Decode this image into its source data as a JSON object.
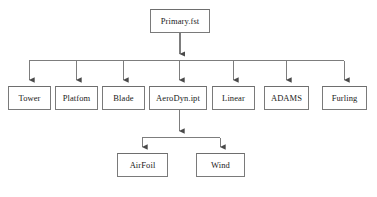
{
  "diagram": {
    "title_text": "",
    "type": "hierarchical-tree-flowchart",
    "colors": {
      "background": "#ffffff",
      "box_border": "#7a7a7a",
      "box_fill": "#ffffff",
      "connector": "#6e6e6e",
      "text": "#1a1a1a"
    },
    "levels": [
      {
        "level": 1,
        "nodes": [
          {
            "id": "primary",
            "label": "Primary.fst",
            "x": 150,
            "y": 9,
            "w": 60,
            "h": 24
          }
        ]
      },
      {
        "level": 2,
        "nodes": [
          {
            "id": "tower",
            "label": "Tower",
            "x": 8,
            "y": 86,
            "w": 43,
            "h": 24
          },
          {
            "id": "platfom",
            "label": "Platfom",
            "x": 55,
            "y": 86,
            "w": 43,
            "h": 24
          },
          {
            "id": "blade",
            "label": "Blade",
            "x": 102,
            "y": 86,
            "w": 43,
            "h": 24
          },
          {
            "id": "aerodyn",
            "label": "AeroDyn.ipt",
            "x": 149,
            "y": 86,
            "w": 58,
            "h": 24
          },
          {
            "id": "linear",
            "label": "Linear",
            "x": 212,
            "y": 86,
            "w": 43,
            "h": 24
          },
          {
            "id": "adams",
            "label": "ADAMS",
            "x": 264,
            "y": 86,
            "w": 45,
            "h": 24
          },
          {
            "id": "furling",
            "label": "Furling",
            "x": 322,
            "y": 86,
            "w": 45,
            "h": 24
          }
        ]
      },
      {
        "level": 3,
        "nodes": [
          {
            "id": "airfoil",
            "label": "AirFoil",
            "x": 117,
            "y": 153,
            "w": 51,
            "h": 24
          },
          {
            "id": "wind",
            "label": "Wind",
            "x": 196,
            "y": 153,
            "w": 49,
            "h": 24
          }
        ]
      }
    ],
    "edges": [
      {
        "from": "primary",
        "to": "bus-level-2",
        "style": "arrow-down"
      },
      {
        "from": "bus-level-2",
        "to": "tower",
        "style": "arrow-down"
      },
      {
        "from": "bus-level-2",
        "to": "platfom",
        "style": "arrow-down"
      },
      {
        "from": "bus-level-2",
        "to": "blade",
        "style": "arrow-down"
      },
      {
        "from": "bus-level-2",
        "to": "aerodyn",
        "style": "arrow-down"
      },
      {
        "from": "bus-level-2",
        "to": "linear",
        "style": "arrow-down"
      },
      {
        "from": "bus-level-2",
        "to": "adams",
        "style": "arrow-down"
      },
      {
        "from": "bus-level-2",
        "to": "furling",
        "style": "arrow-down"
      },
      {
        "from": "aerodyn",
        "to": "bus-level-3",
        "style": "arrow-down"
      },
      {
        "from": "bus-level-3",
        "to": "airfoil",
        "style": "arrow-down"
      },
      {
        "from": "bus-level-3",
        "to": "wind",
        "style": "arrow-down"
      }
    ],
    "bus_bars": [
      {
        "id": "bus-level-2",
        "y": 60,
        "x1": 29,
        "x2": 344
      },
      {
        "id": "bus-level-3",
        "y": 137,
        "x1": 142,
        "x2": 220
      }
    ]
  }
}
